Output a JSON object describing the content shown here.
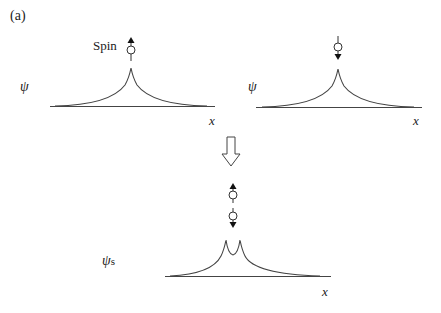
{
  "figure": {
    "panel_label": "(a)",
    "spin_label": "Spin",
    "panels": [
      {
        "id": "spin-up",
        "y_label": "ψ",
        "x_label": "x",
        "spin": "up"
      },
      {
        "id": "spin-down",
        "y_label": "ψ",
        "x_label": "x",
        "spin": "down"
      },
      {
        "id": "singlet",
        "y_label": "ψ",
        "y_label_sub": "s",
        "x_label": "x",
        "spins": [
          "up",
          "down"
        ]
      }
    ],
    "transition": "downward-arrow"
  }
}
